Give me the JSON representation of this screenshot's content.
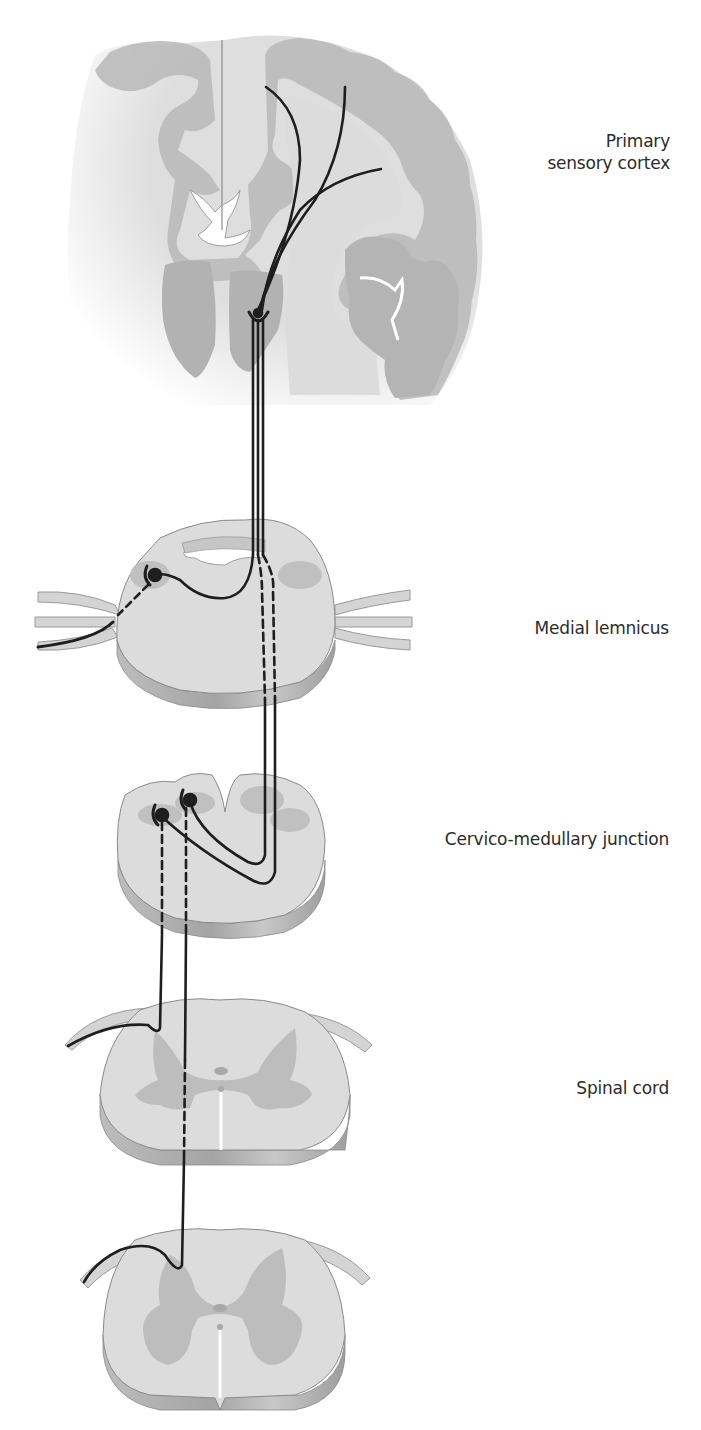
{
  "figure": {
    "type": "anatomical-pathway-diagram"
  },
  "labels": {
    "cortex": {
      "line1": "Primary",
      "line2": "sensory cortex"
    },
    "medial_lemniscus": "Medial lemnicus",
    "cervico_medullary": "Cervico-medullary junction",
    "spinal_cord": "Spinal cord"
  },
  "colors": {
    "background": "#ffffff",
    "white_matter": "#dcdcdc",
    "gray_matter": "#b4b4b4",
    "slab_side": "#a8a8a8",
    "outline": "#8a8a8a",
    "fiber": "#1e1e1e",
    "ventricle": "#ffffff",
    "label_text": "#2b2b2b"
  },
  "sections": [
    {
      "id": "cortex",
      "name": "Brain coronal section"
    },
    {
      "id": "thalamus-level",
      "name": "Brainstem section (medial lemniscus)"
    },
    {
      "id": "medulla",
      "name": "Cervico-medullary junction section"
    },
    {
      "id": "spinal-upper",
      "name": "Upper spinal cord section"
    },
    {
      "id": "spinal-lower",
      "name": "Lower spinal cord section"
    }
  ]
}
